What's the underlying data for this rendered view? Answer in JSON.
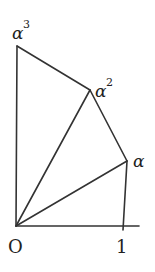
{
  "figure": {
    "stroke_color": "#333333",
    "points": {
      "O": {
        "label": "O",
        "x": 16,
        "y": 226
      },
      "one": {
        "label": "1",
        "x": 123,
        "y": 226
      },
      "alpha": {
        "label": "α",
        "x": 127,
        "y": 161
      },
      "alpha2": {
        "label": "α",
        "sup": "2",
        "x": 90,
        "y": 90
      },
      "alpha3": {
        "label": "α",
        "sup": "3",
        "x": 17,
        "y": 46
      }
    },
    "labels": {
      "origin": "O",
      "one": "1",
      "alpha": "α",
      "alpha2_base": "α",
      "alpha2_sup": "2",
      "alpha3_base": "α",
      "alpha3_sup": "3"
    }
  }
}
